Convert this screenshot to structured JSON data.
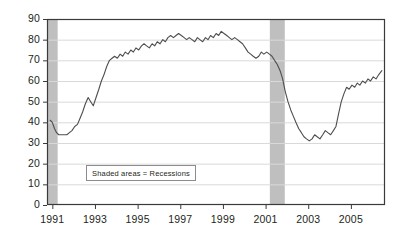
{
  "chart_data": {
    "type": "line",
    "title": "",
    "subtitle": "",
    "xlabel": "",
    "ylabel": "",
    "xlim": [
      1990.75,
      2006.6
    ],
    "ylim": [
      0,
      90
    ],
    "grid": true,
    "grid_axis": "y",
    "legend_position": "inside-lower-left",
    "line_color": "#4d4d4d",
    "grid_color": "#d9d9d9",
    "axis_color": "#3a3a3a",
    "shade_color": "#bfbfbf",
    "annotations": [
      {
        "name": "legend-note",
        "text": "Shaded areas = Recessions"
      }
    ],
    "yticks": [
      0,
      10,
      20,
      30,
      40,
      50,
      60,
      70,
      80,
      90
    ],
    "ytick_labels": [
      "0",
      "10",
      "20",
      "30",
      "40",
      "50",
      "60",
      "70",
      "80",
      "90"
    ],
    "xticks": [
      1991,
      1993,
      1995,
      1997,
      1999,
      2001,
      2003,
      2005
    ],
    "xtick_labels": [
      "1991",
      "1993",
      "1995",
      "1997",
      "1999",
      "2001",
      "2003",
      "2005"
    ],
    "shaded_regions": [
      {
        "name": "recession-1990-1991",
        "x0": 1990.75,
        "x1": 1991.25,
        "label": "Recession"
      },
      {
        "name": "recession-2001",
        "x0": 2001.2,
        "x1": 2001.9,
        "label": "Recession"
      }
    ],
    "series": [
      {
        "name": "Consumer Confidence Index",
        "x": [
          1990.9,
          1991.0,
          1991.1,
          1991.2,
          1991.3,
          1991.42,
          1991.55,
          1991.68,
          1991.8,
          1991.92,
          1992.05,
          1992.18,
          1992.3,
          1992.42,
          1992.55,
          1992.68,
          1992.8,
          1992.92,
          1993.05,
          1993.18,
          1993.3,
          1993.42,
          1993.55,
          1993.68,
          1993.8,
          1993.92,
          1994.05,
          1994.18,
          1994.3,
          1994.42,
          1994.55,
          1994.68,
          1994.8,
          1994.92,
          1995.05,
          1995.18,
          1995.3,
          1995.42,
          1995.55,
          1995.68,
          1995.8,
          1995.92,
          1996.05,
          1996.18,
          1996.3,
          1996.42,
          1996.55,
          1996.68,
          1996.8,
          1996.92,
          1997.05,
          1997.18,
          1997.3,
          1997.42,
          1997.55,
          1997.68,
          1997.8,
          1997.92,
          1998.05,
          1998.18,
          1998.3,
          1998.42,
          1998.55,
          1998.68,
          1998.8,
          1998.92,
          1999.05,
          1999.18,
          1999.3,
          1999.42,
          1999.55,
          1999.68,
          1999.8,
          1999.92,
          2000.05,
          2000.18,
          2000.3,
          2000.42,
          2000.55,
          2000.68,
          2000.8,
          2000.92,
          2001.05,
          2001.18,
          2001.3,
          2001.42,
          2001.55,
          2001.68,
          2001.8,
          2001.92,
          2002.05,
          2002.18,
          2002.3,
          2002.42,
          2002.55,
          2002.68,
          2002.8,
          2002.92,
          2003.05,
          2003.18,
          2003.3,
          2003.42,
          2003.55,
          2003.68,
          2003.8,
          2003.92,
          2004.05,
          2004.18,
          2004.3,
          2004.42,
          2004.55,
          2004.68,
          2004.8,
          2004.92,
          2005.05,
          2005.18,
          2005.3,
          2005.42,
          2005.55,
          2005.68,
          2005.8,
          2005.92,
          2006.05,
          2006.18,
          2006.3,
          2006.45
        ],
        "values": [
          41,
          40,
          37,
          35,
          34,
          34,
          34,
          34,
          35,
          36,
          38,
          39,
          42,
          45,
          49,
          52,
          50,
          48,
          52,
          56,
          60,
          63,
          67,
          70,
          71,
          72,
          71,
          73,
          72,
          74,
          73,
          75,
          74,
          76,
          75,
          77,
          78,
          77,
          76,
          78,
          77,
          79,
          78,
          80,
          79,
          81,
          82,
          81,
          82,
          83,
          82,
          81,
          80,
          81,
          80,
          79,
          81,
          80,
          79,
          81,
          80,
          82,
          81,
          83,
          82,
          84,
          83,
          82,
          81,
          80,
          81,
          80,
          79,
          78,
          76,
          74,
          73,
          72,
          71,
          72,
          74,
          73,
          74,
          73,
          72,
          70,
          68,
          65,
          61,
          55,
          50,
          46,
          43,
          40,
          37,
          35,
          33,
          32,
          31,
          32,
          34,
          33,
          32,
          34,
          36,
          35,
          34,
          36,
          38,
          44,
          50,
          54,
          57,
          56,
          58,
          57,
          59,
          58,
          60,
          59,
          61,
          60,
          62,
          61,
          63,
          65
        ]
      }
    ]
  },
  "axes": {
    "y_label_prefix": "",
    "x_label_prefix": ""
  }
}
